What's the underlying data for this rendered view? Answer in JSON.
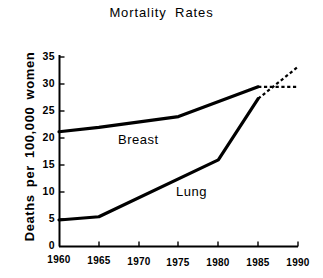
{
  "chart_data": {
    "type": "line",
    "title": "Mortality  Rates",
    "xlabel": "",
    "ylabel": "Deaths  per  100,000  women",
    "xlim": [
      1960,
      1990
    ],
    "ylim": [
      0,
      35
    ],
    "grid": false,
    "legend_position": "inline-annotations",
    "xticks": [
      1960,
      1965,
      1970,
      1975,
      1980,
      1985,
      1990
    ],
    "yticks": [
      0,
      5,
      10,
      15,
      20,
      25,
      30,
      35
    ],
    "xtick_labels": [
      "1960",
      "1965",
      "1970",
      "1975",
      "1980",
      "1985",
      "1990"
    ],
    "ytick_labels": [
      "0",
      "5",
      "10",
      "15",
      "20",
      "25",
      "30",
      "35"
    ],
    "series": [
      {
        "name": "Breast",
        "style": "solid",
        "color": "#000000",
        "x": [
          1960,
          1965,
          1975,
          1985
        ],
        "values": [
          21.2,
          22.0,
          24.0,
          29.5
        ],
        "projection": {
          "style": "dashed",
          "x": [
            1985,
            1990
          ],
          "values": [
            29.5,
            29.5
          ]
        }
      },
      {
        "name": "Lung",
        "style": "solid",
        "color": "#000000",
        "x": [
          1960,
          1965,
          1980,
          1985
        ],
        "values": [
          4.9,
          5.5,
          16.0,
          27.3
        ],
        "projection": {
          "style": "dashed",
          "x": [
            1985,
            1990
          ],
          "values": [
            27.3,
            33.2
          ]
        }
      }
    ],
    "annotations": [
      {
        "text": "Breast",
        "x": 1974.5,
        "y": 20.2
      },
      {
        "text": "Lung",
        "x": 1981.0,
        "y": 10.5
      }
    ]
  },
  "axis": {
    "y_title": "Deaths  per  100,000  women",
    "tick_labels_y": {
      "t0": "0",
      "t1": "5",
      "t2": "10",
      "t3": "15",
      "t4": "20",
      "t5": "25",
      "t6": "30",
      "t7": "35"
    },
    "tick_labels_x": {
      "t0": "1960",
      "t1": "1965",
      "t2": "1970",
      "t3": "1975",
      "t4": "1980",
      "t5": "1985",
      "t6": "1990"
    }
  },
  "labels": {
    "title": "Mortality  Rates",
    "breast": "Breast",
    "lung": "Lung"
  }
}
